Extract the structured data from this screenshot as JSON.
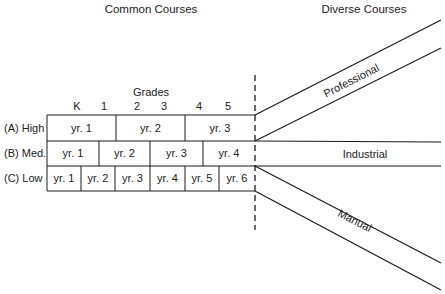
{
  "headers": {
    "common": "Common Courses",
    "diverse": "Diverse Courses"
  },
  "grades": {
    "title": "Grades",
    "ticks": [
      "K",
      "1",
      "2",
      "3",
      "4",
      "5"
    ]
  },
  "rows": [
    {
      "label": "(A) High",
      "cells": [
        "yr. 1",
        "yr. 2",
        "yr. 3"
      ]
    },
    {
      "label": "(B) Med.",
      "cells": [
        "yr. 1",
        "yr. 2",
        "yr. 3",
        "yr. 4"
      ]
    },
    {
      "label": "(C) Low",
      "cells": [
        "yr. 1",
        "yr. 2",
        "yr. 3",
        "yr. 4",
        "yr. 5",
        "yr. 6"
      ]
    }
  ],
  "tracks": {
    "professional": "Professional",
    "industrial": "Industrial",
    "manual": "Manual"
  }
}
